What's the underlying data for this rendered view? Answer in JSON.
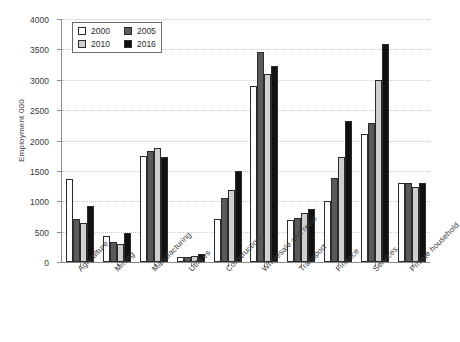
{
  "chart_data": {
    "type": "bar",
    "title": "",
    "xlabel": "",
    "ylabel": "Employment 000",
    "ylim": [
      0,
      4000
    ],
    "ytick_step": 500,
    "yticks": [
      4000,
      3500,
      3000,
      2500,
      2000,
      1500,
      1000,
      500,
      0
    ],
    "grid": true,
    "legend_position": "top-left",
    "categories": [
      "Agriculture",
      "Mining",
      "Manufacturing",
      "Utilities",
      "Construction",
      "Wholesale and retail",
      "Transport",
      "Finance",
      "Services",
      "Private household"
    ],
    "series": [
      {
        "name": "2000",
        "color": "#ffffff",
        "values": [
          1370,
          430,
          1750,
          90,
          710,
          2900,
          690,
          1010,
          2110,
          1300
        ]
      },
      {
        "name": "2005",
        "color": "#5a5a5a",
        "values": [
          700,
          330,
          1830,
          80,
          1050,
          3450,
          720,
          1390,
          2290,
          1300
        ]
      },
      {
        "name": "2010",
        "color": "#cfcfcf",
        "values": [
          640,
          300,
          1880,
          100,
          1190,
          3100,
          810,
          1730,
          3000,
          1230
        ]
      },
      {
        "name": "2016",
        "color": "#111111",
        "values": [
          930,
          480,
          1730,
          140,
          1490,
          3220,
          880,
          2320,
          3590,
          1300
        ]
      }
    ]
  }
}
